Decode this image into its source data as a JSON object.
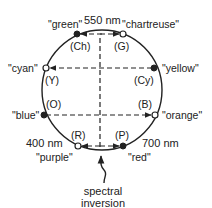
{
  "diagram": {
    "labels": {
      "nm550": "550 nm",
      "nm400": "400 nm",
      "nm700": "700 nm",
      "caption_line1": "spectral",
      "caption_line2": "inversion"
    },
    "points": [
      {
        "id": "Ch",
        "code": "(Ch)",
        "name": "\"green\"",
        "filled": true
      },
      {
        "id": "G",
        "code": "(G)",
        "name": "\"chartreuse\"",
        "filled": false
      },
      {
        "id": "Y",
        "code": "(Y)",
        "name": "\"cyan\"",
        "filled": false
      },
      {
        "id": "Cy",
        "code": "(Cy)",
        "name": "\"yellow\"",
        "filled": true
      },
      {
        "id": "O",
        "code": "(O)",
        "name": "\"blue\"",
        "filled": true
      },
      {
        "id": "B",
        "code": "(B)",
        "name": "\"orange\"",
        "filled": false
      },
      {
        "id": "R",
        "code": "(R)",
        "name": "\"purple\"",
        "filled": false
      },
      {
        "id": "P",
        "code": "(P)",
        "name": "\"red\"",
        "filled": true
      }
    ],
    "colors": {
      "stroke": "#222222",
      "background": "#ffffff"
    }
  }
}
